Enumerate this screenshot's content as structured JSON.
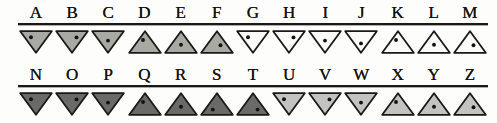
{
  "chart_data": {
    "type": "table",
    "colors": {
      "ink": "#1b1917",
      "medium_gray": "#a9a9a4",
      "dark_gray": "#6a6a68",
      "light_gray": "#c3c3bf",
      "white": "#fbfbf9",
      "dot": "#151310",
      "page": "#fdfdfc"
    },
    "columns": [
      "letter",
      "orientation",
      "fill",
      "dot"
    ],
    "rows": [
      {
        "letter": "A",
        "orientation": "down",
        "fill": "medium_gray",
        "dot": "upper-left"
      },
      {
        "letter": "B",
        "orientation": "down",
        "fill": "medium_gray",
        "dot": "upper-right"
      },
      {
        "letter": "C",
        "orientation": "down",
        "fill": "medium_gray",
        "dot": "center"
      },
      {
        "letter": "D",
        "orientation": "up",
        "fill": "medium_gray",
        "dot": "upper-left"
      },
      {
        "letter": "E",
        "orientation": "up",
        "fill": "medium_gray",
        "dot": "center"
      },
      {
        "letter": "F",
        "orientation": "up",
        "fill": "medium_gray",
        "dot": "upper-right"
      },
      {
        "letter": "G",
        "orientation": "down",
        "fill": "white",
        "dot": "upper-left"
      },
      {
        "letter": "H",
        "orientation": "down",
        "fill": "white",
        "dot": "upper-right"
      },
      {
        "letter": "I",
        "orientation": "down",
        "fill": "white",
        "dot": "center"
      },
      {
        "letter": "J",
        "orientation": "down",
        "fill": "white",
        "dot": "lower"
      },
      {
        "letter": "K",
        "orientation": "up",
        "fill": "white",
        "dot": "upper-left"
      },
      {
        "letter": "L",
        "orientation": "up",
        "fill": "white",
        "dot": "center"
      },
      {
        "letter": "M",
        "orientation": "up",
        "fill": "white",
        "dot": "upper-right"
      },
      {
        "letter": "N",
        "orientation": "down",
        "fill": "dark_gray",
        "dot": "upper-left"
      },
      {
        "letter": "O",
        "orientation": "down",
        "fill": "dark_gray",
        "dot": "upper-right"
      },
      {
        "letter": "P",
        "orientation": "down",
        "fill": "dark_gray",
        "dot": "center"
      },
      {
        "letter": "Q",
        "orientation": "up",
        "fill": "dark_gray",
        "dot": "upper-left"
      },
      {
        "letter": "R",
        "orientation": "up",
        "fill": "dark_gray",
        "dot": "center"
      },
      {
        "letter": "S",
        "orientation": "up",
        "fill": "dark_gray",
        "dot": "lower-left"
      },
      {
        "letter": "T",
        "orientation": "up",
        "fill": "dark_gray",
        "dot": "lower-right"
      },
      {
        "letter": "U",
        "orientation": "down",
        "fill": "light_gray",
        "dot": "upper-left"
      },
      {
        "letter": "V",
        "orientation": "down",
        "fill": "light_gray",
        "dot": "upper-right"
      },
      {
        "letter": "W",
        "orientation": "down",
        "fill": "light_gray",
        "dot": "center"
      },
      {
        "letter": "X",
        "orientation": "up",
        "fill": "light_gray",
        "dot": "upper-left"
      },
      {
        "letter": "Y",
        "orientation": "up",
        "fill": "light_gray",
        "dot": "center"
      },
      {
        "letter": "Z",
        "orientation": "up",
        "fill": "light_gray",
        "dot": "upper-right"
      }
    ],
    "layout": {
      "rows_of_glyphs": 2,
      "items_per_row": 13,
      "row_1_letters": [
        "A",
        "B",
        "C",
        "D",
        "E",
        "F",
        "G",
        "H",
        "I",
        "J",
        "K",
        "L",
        "M"
      ],
      "row_2_letters": [
        "N",
        "O",
        "P",
        "Q",
        "R",
        "S",
        "T",
        "U",
        "V",
        "W",
        "X",
        "Y",
        "Z"
      ],
      "rule_under_letters": true
    }
  }
}
